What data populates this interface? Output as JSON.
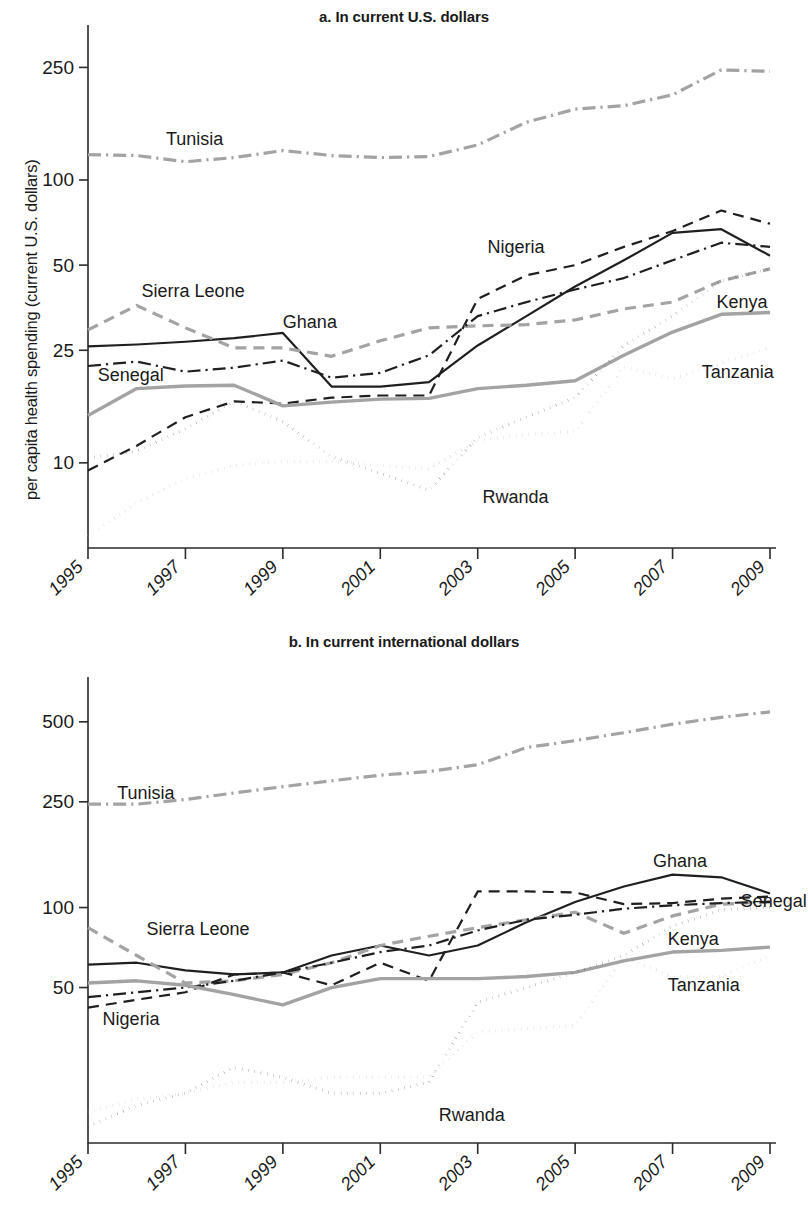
{
  "figure": {
    "panel_a_title": "a. In current U.S. dollars",
    "panel_b_title": "b. In current international dollars",
    "panel_a_ylabel": "per capita health spending (current U.S. dollars)",
    "panel_b_ylabel": "per capita health spending (current international dollars)"
  },
  "colors": {
    "black": "#1f1f1f",
    "gray": "#a3a3a3",
    "axis": "#2b2b2b"
  },
  "chart_data": [
    {
      "type": "line",
      "title": "a. In current U.S. dollars",
      "xlabel": "",
      "ylabel": "per capita health spending (current U.S. dollars)",
      "yscale": "log",
      "ylim": [
        5,
        300
      ],
      "yticks": [
        10,
        25,
        50,
        100,
        250
      ],
      "ytick_labels": [
        "10",
        "25",
        "50",
        "100",
        "250"
      ],
      "x": [
        1995,
        1996,
        1997,
        1998,
        1999,
        2000,
        2001,
        2002,
        2003,
        2004,
        2005,
        2006,
        2007,
        2008,
        2009
      ],
      "xticks": [
        1995,
        1997,
        1999,
        2001,
        2003,
        2005,
        2007,
        2009
      ],
      "xtick_labels": [
        "1995",
        "1997",
        "1999",
        "2001",
        "2003",
        "2005",
        "2007",
        "2009"
      ],
      "grid": false,
      "legend": "inline-labels",
      "series": [
        {
          "name": "Tunisia",
          "style": "dashdot",
          "color": "gray",
          "width": 3.2,
          "values": [
            123,
            122,
            116,
            120,
            127,
            122,
            120,
            121,
            133,
            160,
            178,
            183,
            200,
            245,
            242
          ]
        },
        {
          "name": "Nigeria",
          "style": "dashed",
          "color": "black",
          "width": 2.2,
          "values": [
            9.4,
            11.5,
            14.5,
            16.5,
            16.2,
            17.0,
            17.3,
            17.3,
            38.0,
            46.0,
            50.0,
            58.0,
            66.0,
            78.0,
            70.0
          ]
        },
        {
          "name": "Ghana",
          "style": "solid",
          "color": "black",
          "width": 2.2,
          "values": [
            25.8,
            26.2,
            26.8,
            27.6,
            28.8,
            18.6,
            18.6,
            19.3,
            26.0,
            33.0,
            42.0,
            52.0,
            65.0,
            67.0,
            54.0
          ]
        },
        {
          "name": "Sierra Leone",
          "style": "dashed",
          "color": "gray",
          "width": 3.2,
          "values": [
            29.5,
            36.0,
            30.0,
            25.5,
            25.5,
            23.8,
            27.0,
            30.0,
            30.5,
            30.8,
            32.0,
            35.0,
            37.0,
            44.0,
            48.5
          ]
        },
        {
          "name": "Senegal",
          "style": "dashdot",
          "color": "black",
          "width": 2.2,
          "values": [
            22.0,
            22.8,
            21.0,
            21.7,
            23.0,
            20.0,
            20.8,
            24.0,
            33.0,
            37.0,
            41.0,
            45.0,
            52.0,
            60.0,
            58.0
          ]
        },
        {
          "name": "Kenya",
          "style": "solid",
          "color": "gray",
          "width": 3.4,
          "values": [
            14.7,
            18.3,
            18.7,
            18.8,
            15.9,
            16.4,
            16.8,
            16.9,
            18.3,
            18.8,
            19.5,
            24.0,
            29.0,
            33.5,
            34.0
          ]
        },
        {
          "name": "Rwanda",
          "style": "dotted",
          "color": "black",
          "width": 3.0,
          "values": [
            10.4,
            11.0,
            13.2,
            16.5,
            14.0,
            10.5,
            9.2,
            8.0,
            12.3,
            14.5,
            17.0,
            26.0,
            33.0,
            44.0,
            48.5
          ]
        },
        {
          "name": "Tanzania",
          "style": "dotted",
          "color": "gray",
          "width": 3.2,
          "values": [
            5.5,
            7.2,
            8.8,
            9.8,
            10.1,
            10.1,
            9.8,
            9.5,
            12.0,
            12.6,
            12.9,
            21.8,
            19.8,
            22.5,
            25.5
          ]
        }
      ],
      "annotations": [
        {
          "text": "Tunisia",
          "x": 1996.6,
          "y": 140
        },
        {
          "text": "Sierra Leone",
          "x": 1996.1,
          "y": 40.5
        },
        {
          "text": "Ghana",
          "x": 1999.0,
          "y": 31.5
        },
        {
          "text": "Senegal",
          "x": 1995.2,
          "y": 20.5
        },
        {
          "text": "Nigeria",
          "x": 2003.2,
          "y": 58
        },
        {
          "text": "Kenya",
          "x": 2007.9,
          "y": 37
        },
        {
          "text": "Tanzania",
          "x": 2007.6,
          "y": 21
        },
        {
          "text": "Rwanda",
          "x": 2003.1,
          "y": 7.6
        }
      ]
    },
    {
      "type": "line",
      "title": "b. In current international dollars",
      "xlabel": "",
      "ylabel": "per capita health spending (current international dollars)",
      "yscale": "log",
      "ylim": [
        13,
        620
      ],
      "yticks": [
        50,
        100,
        250,
        500
      ],
      "ytick_labels": [
        "50",
        "100",
        "250",
        "500"
      ],
      "x": [
        1995,
        1996,
        1997,
        1998,
        1999,
        2000,
        2001,
        2002,
        2003,
        2004,
        2005,
        2006,
        2007,
        2008,
        2009
      ],
      "xticks": [
        1995,
        1997,
        1999,
        2001,
        2003,
        2005,
        2007,
        2009
      ],
      "xtick_labels": [
        "1995",
        "1997",
        "1999",
        "2001",
        "2003",
        "2005",
        "2007",
        "2009"
      ],
      "grid": false,
      "legend": "inline-labels",
      "series": [
        {
          "name": "Tunisia",
          "style": "dashdot",
          "color": "gray",
          "width": 3.2,
          "values": [
            245,
            245,
            255,
            270,
            285,
            300,
            315,
            325,
            345,
            400,
            425,
            455,
            490,
            520,
            545
          ]
        },
        {
          "name": "Ghana",
          "style": "solid",
          "color": "black",
          "width": 2.2,
          "values": [
            61,
            62,
            58,
            56,
            57,
            66,
            72,
            66,
            72,
            88,
            105,
            120,
            133,
            130,
            113
          ]
        },
        {
          "name": "Sierra Leone",
          "style": "dashed",
          "color": "gray",
          "width": 3.2,
          "values": [
            84,
            66,
            52,
            53,
            56,
            62,
            72,
            78,
            84,
            90,
            96,
            80,
            93,
            103,
            105
          ]
        },
        {
          "name": "Senegal",
          "style": "dashdot",
          "color": "black",
          "width": 2.2,
          "values": [
            46,
            48,
            50,
            53,
            57,
            62,
            68,
            72,
            82,
            90,
            94,
            99,
            102,
            104,
            105
          ]
        },
        {
          "name": "Nigeria",
          "style": "dashed",
          "color": "black",
          "width": 2.2,
          "values": [
            42,
            45,
            48,
            56,
            57,
            51,
            62,
            53,
            115,
            115,
            114,
            103,
            104,
            108,
            110
          ]
        },
        {
          "name": "Kenya",
          "style": "solid",
          "color": "gray",
          "width": 3.4,
          "values": [
            52,
            53,
            51,
            47,
            43,
            50,
            54,
            54,
            54,
            55,
            57,
            63,
            68,
            69,
            71
          ]
        },
        {
          "name": "Rwanda",
          "style": "dotted",
          "color": "black",
          "width": 3.0,
          "values": [
            15,
            18,
            20,
            25,
            23,
            20,
            20,
            22,
            44,
            50,
            57,
            66,
            85,
            98,
            100
          ]
        },
        {
          "name": "Tanzania",
          "style": "dotted",
          "color": "gray",
          "width": 3.2,
          "values": [
            17,
            19,
            20,
            22,
            22,
            23,
            23,
            23,
            34,
            35,
            36,
            65,
            55,
            55,
            66
          ]
        }
      ],
      "annotations": [
        {
          "text": "Tunisia",
          "x": 1995.6,
          "y": 270
        },
        {
          "text": "Sierra Leone",
          "x": 1996.2,
          "y": 83
        },
        {
          "text": "Ghana",
          "x": 2006.6,
          "y": 150
        },
        {
          "text": "Senegal",
          "x": 2008.4,
          "y": 106
        },
        {
          "text": "Nigeria",
          "x": 1995.3,
          "y": 38
        },
        {
          "text": "Kenya",
          "x": 2006.9,
          "y": 76
        },
        {
          "text": "Tanzania",
          "x": 2006.9,
          "y": 51
        },
        {
          "text": "Rwanda",
          "x": 2002.2,
          "y": 16.6
        }
      ]
    }
  ]
}
